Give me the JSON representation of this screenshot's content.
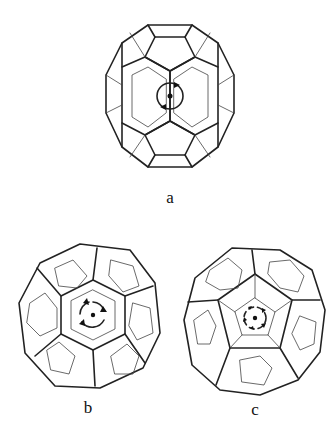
{
  "figure": {
    "panels": [
      {
        "id": "a",
        "label": "a",
        "symmetry_axis": "2-fold",
        "center_symbol": "two-fold rotation arrows"
      },
      {
        "id": "b",
        "label": "b",
        "symmetry_axis": "3-fold",
        "center_symbol": "three-fold rotation arrows"
      },
      {
        "id": "c",
        "label": "c",
        "symmetry_axis": "5-fold",
        "center_symbol": "five-fold rotation arrows"
      }
    ]
  },
  "colors": {
    "line": "#222222",
    "background": "#ffffff"
  }
}
